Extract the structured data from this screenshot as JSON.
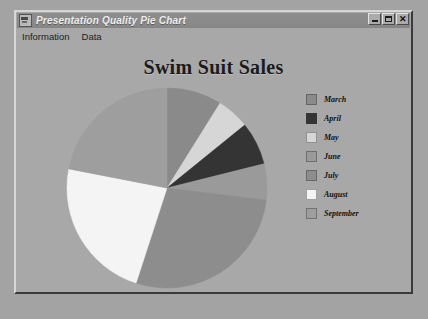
{
  "window": {
    "title": "Presentation Quality Pie Chart",
    "icon": "app-chart-icon",
    "buttons": {
      "minimize": "_",
      "maximize": "□",
      "close": "✕"
    },
    "menus": [
      {
        "label": "Information"
      },
      {
        "label": "Data"
      }
    ]
  },
  "colors": {
    "desktop_background": "#a3a3a3",
    "window_background": "#a8a8a8",
    "titlebar": "#8a8a8a",
    "titlebar_text": "#efefef",
    "title_text": "#1b1b1b"
  },
  "chart_data": {
    "type": "pie",
    "title": "Swim Suit Sales",
    "xlabel": "",
    "ylabel": "",
    "legend_position": "right",
    "grid": false,
    "start_angle_deg": 0,
    "direction": "clockwise",
    "categories": [
      "March",
      "April",
      "May",
      "June",
      "July",
      "August",
      "September"
    ],
    "values": [
      9,
      7,
      5,
      6,
      28,
      23,
      22
    ],
    "colors": [
      "#8a8a8a",
      "#343434",
      "#d6d6d6",
      "#9a9a9a",
      "#8d8d8d",
      "#f4f4f4",
      "#9e9e9e"
    ],
    "slices": [
      {
        "label": "March",
        "value": 9,
        "color": "#8a8a8a",
        "start_deg": 0,
        "end_deg": 32
      },
      {
        "label": "May",
        "value": 5,
        "color": "#d6d6d6",
        "start_deg": 32,
        "end_deg": 51
      },
      {
        "label": "April",
        "value": 7,
        "color": "#343434",
        "start_deg": 51,
        "end_deg": 76
      },
      {
        "label": "June",
        "value": 6,
        "color": "#9a9a9a",
        "start_deg": 76,
        "end_deg": 97
      },
      {
        "label": "July",
        "value": 28,
        "color": "#8d8d8d",
        "start_deg": 97,
        "end_deg": 198
      },
      {
        "label": "August",
        "value": 23,
        "color": "#f4f4f4",
        "start_deg": 198,
        "end_deg": 281
      },
      {
        "label": "September",
        "value": 22,
        "color": "#9e9e9e",
        "start_deg": 281,
        "end_deg": 360
      }
    ]
  },
  "legend": {
    "items": [
      {
        "label": "March",
        "color": "#8a8a8a"
      },
      {
        "label": "April",
        "color": "#343434"
      },
      {
        "label": "May",
        "color": "#d6d6d6"
      },
      {
        "label": "June",
        "color": "#9a9a9a"
      },
      {
        "label": "July",
        "color": "#8d8d8d"
      },
      {
        "label": "August",
        "color": "#f4f4f4"
      },
      {
        "label": "September",
        "color": "#9e9e9e"
      }
    ]
  }
}
